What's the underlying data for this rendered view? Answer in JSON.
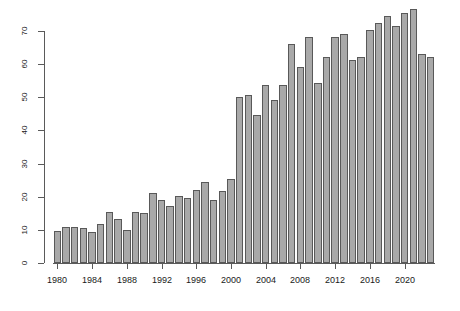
{
  "chart_data": {
    "type": "bar",
    "title": "",
    "subtitle": "",
    "xlabel": "",
    "ylabel": "",
    "grid": false,
    "legend": "none",
    "xlim": [
      1979.5,
      2023.5
    ],
    "ylim": [
      0,
      75
    ],
    "y_ticks": [
      0,
      10,
      20,
      30,
      40,
      50,
      60,
      70
    ],
    "x_ticks": [
      1980,
      1984,
      1988,
      1992,
      1996,
      2000,
      2004,
      2008,
      2012,
      2016,
      2020
    ],
    "categories": [
      "1980",
      "1981",
      "1982",
      "1983",
      "1984",
      "1985",
      "1986",
      "1987",
      "1988",
      "1989",
      "1990",
      "1991",
      "1992",
      "1993",
      "1994",
      "1995",
      "1996",
      "1997",
      "1998",
      "1999",
      "2000",
      "2001",
      "2002",
      "2003",
      "2004",
      "2005",
      "2006",
      "2007",
      "2008",
      "2009",
      "2010",
      "2011",
      "2012",
      "2013",
      "2014",
      "2015",
      "2016",
      "2017",
      "2018",
      "2019",
      "2020",
      "2021",
      "2022",
      "2023"
    ],
    "values": [
      9.7,
      10.9,
      11.0,
      10.5,
      9.5,
      11.7,
      15.5,
      13.4,
      10.1,
      15.5,
      15.0,
      21.0,
      19.1,
      17.1,
      20.1,
      19.6,
      22.1,
      24.5,
      19.1,
      21.6,
      25.2,
      50.1,
      50.6,
      44.6,
      53.7,
      49.2,
      53.8,
      66.2,
      59.2,
      68.1,
      54.2,
      62.1,
      68.2,
      69.2,
      61.2,
      62.1,
      70.2,
      72.3,
      74.4,
      71.4,
      75.3,
      76.5,
      63.1,
      62.1
    ],
    "bar_color": "#a9a9a9",
    "bar_border_color": "#595959",
    "axis_color": "#5a5a5a",
    "background": "#ffffff"
  }
}
